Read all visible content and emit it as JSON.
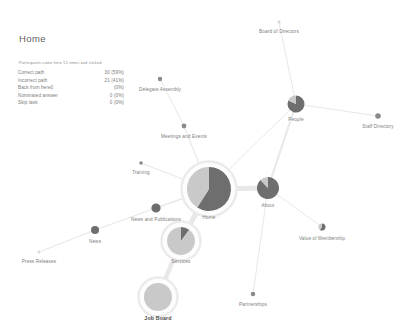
{
  "panel": {
    "title": "Home",
    "subtitle": "Participants came here 51 times and clicked",
    "rows": [
      {
        "label": "Correct path",
        "value": "30 (59%)"
      },
      {
        "label": "Incorrect path",
        "value": "21 (41%)"
      },
      {
        "label": "Back from here0",
        "value": "(0%)"
      },
      {
        "label": "Nominated answer",
        "value": "0 (0%)"
      },
      {
        "label": "Skip task",
        "value": "0 (0%)"
      }
    ]
  },
  "colors": {
    "dark_slice": "#6e6e6e",
    "light_slice": "#c9c9c9",
    "small_node": "#8a8a8a",
    "tiny_node": "#d8d8d8",
    "edge": "#e8e8e8",
    "ring": "#eceaea",
    "label": "#7d7d7d"
  },
  "chart_data": {
    "type": "diagram",
    "title": "Home",
    "nodes": [
      {
        "id": "home",
        "label": "Home",
        "x": 209,
        "y": 189,
        "r": 22,
        "ring": true,
        "bold": false,
        "label_dx": 0,
        "label_dy": 30,
        "slices": [
          59,
          41
        ]
      },
      {
        "id": "services",
        "label": "Services",
        "x": 181,
        "y": 241,
        "r": 14,
        "ring": true,
        "bold": false,
        "label_dx": 0,
        "label_dy": 22,
        "slices": [
          10,
          90
        ]
      },
      {
        "id": "job_board",
        "label": "Job Board",
        "x": 158,
        "y": 297,
        "r": 14,
        "ring": true,
        "bold": true,
        "label_dx": 0,
        "label_dy": 23,
        "slices": [
          0,
          100
        ]
      },
      {
        "id": "about",
        "label": "About",
        "x": 268,
        "y": 188,
        "r": 11,
        "ring": false,
        "bold": false,
        "label_dx": 0,
        "label_dy": 19,
        "slices": [
          88,
          12
        ]
      },
      {
        "id": "people",
        "label": "People",
        "x": 296,
        "y": 104,
        "r": 8.5,
        "ring": false,
        "bold": false,
        "label_dx": 0,
        "label_dy": 17,
        "slices": [
          82,
          18
        ]
      },
      {
        "id": "news_pubs",
        "label": "News and Publications",
        "x": 156,
        "y": 208,
        "r": 4.6,
        "ring": false,
        "bold": false,
        "label_dx": 0,
        "label_dy": 13,
        "slices": [
          100,
          0
        ]
      },
      {
        "id": "news",
        "label": "News",
        "x": 95,
        "y": 230,
        "r": 4.0,
        "ring": false,
        "bold": false,
        "label_dx": 0,
        "label_dy": 13,
        "slices": [
          100,
          0
        ]
      },
      {
        "id": "press_releases",
        "label": "Press Releases",
        "x": 39,
        "y": 252,
        "r": 1.5,
        "ring": false,
        "bold": false,
        "label_dx": 0,
        "label_dy": 11,
        "slices": [
          0,
          100
        ]
      },
      {
        "id": "training",
        "label": "Training",
        "x": 141,
        "y": 163,
        "r": 1.8,
        "ring": false,
        "bold": false,
        "label_dx": 0,
        "label_dy": 11,
        "slices": [
          100,
          0
        ]
      },
      {
        "id": "meetings",
        "label": "Meetings and Events",
        "x": 184,
        "y": 126,
        "r": 2.4,
        "ring": false,
        "bold": false,
        "label_dx": 0,
        "label_dy": 12,
        "slices": [
          100,
          0
        ]
      },
      {
        "id": "delegate",
        "label": "Delegate Assembly",
        "x": 160,
        "y": 79,
        "r": 2.2,
        "ring": false,
        "bold": false,
        "label_dx": 0,
        "label_dy": 12,
        "slices": [
          100,
          0
        ]
      },
      {
        "id": "board",
        "label": "Board of Directors",
        "x": 279,
        "y": 22,
        "r": 1.6,
        "ring": false,
        "bold": false,
        "label_dx": 0,
        "label_dy": 11,
        "slices": [
          0,
          100
        ]
      },
      {
        "id": "staff_dir",
        "label": "Staff Directory",
        "x": 378,
        "y": 116,
        "r": 2.8,
        "ring": false,
        "bold": false,
        "label_dx": 0,
        "label_dy": 12,
        "slices": [
          70,
          30
        ]
      },
      {
        "id": "value_member",
        "label": "Value of Membership",
        "x": 322,
        "y": 227,
        "r": 3.6,
        "ring": false,
        "bold": false,
        "label_dx": 0,
        "label_dy": 13,
        "slices": [
          60,
          40
        ]
      },
      {
        "id": "partnerships",
        "label": "Partnerships",
        "x": 253,
        "y": 294,
        "r": 2.3,
        "ring": false,
        "bold": false,
        "label_dx": 0,
        "label_dy": 12,
        "slices": [
          100,
          0
        ]
      }
    ],
    "edges": [
      {
        "from": "home",
        "to": "services",
        "w": 5.0
      },
      {
        "from": "services",
        "to": "job_board",
        "w": 4.6
      },
      {
        "from": "home",
        "to": "about",
        "w": 5.2
      },
      {
        "from": "about",
        "to": "people",
        "w": 2.0
      },
      {
        "from": "home",
        "to": "news_pubs",
        "w": 1.5
      },
      {
        "from": "news_pubs",
        "to": "news",
        "w": 1.3
      },
      {
        "from": "news",
        "to": "press_releases",
        "w": 1.1
      },
      {
        "from": "home",
        "to": "training",
        "w": 1.1
      },
      {
        "from": "home",
        "to": "meetings",
        "w": 1.1
      },
      {
        "from": "meetings",
        "to": "delegate",
        "w": 1.0
      },
      {
        "from": "people",
        "to": "board",
        "w": 1.0
      },
      {
        "from": "people",
        "to": "staff_dir",
        "w": 1.0
      },
      {
        "from": "about",
        "to": "value_member",
        "w": 1.0
      },
      {
        "from": "about",
        "to": "partnerships",
        "w": 1.0
      },
      {
        "from": "home",
        "to": "people",
        "w": 1.0
      }
    ]
  },
  "footer": {
    "text": ""
  }
}
